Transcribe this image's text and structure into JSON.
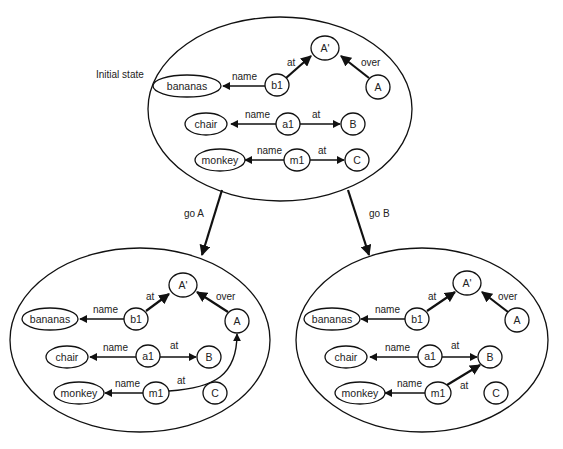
{
  "initial_state": {
    "label": "Initial state",
    "nodes": {
      "bananas": "bananas",
      "b1": "b1",
      "A_prime": "A'",
      "A": "A",
      "chair": "chair",
      "a1": "a1",
      "B": "B",
      "monkey": "monkey",
      "m1": "m1",
      "C": "C"
    },
    "edges": {
      "b1_name": "name",
      "b1_at": "at",
      "A_over": "over",
      "a1_name": "name",
      "a1_at": "at",
      "m1_name": "name",
      "m1_at": "at"
    }
  },
  "transitions": [
    {
      "label": "go A"
    },
    {
      "label": "go B"
    }
  ],
  "state_go_a": {
    "nodes": {
      "bananas": "bananas",
      "b1": "b1",
      "A_prime": "A'",
      "A": "A",
      "chair": "chair",
      "a1": "a1",
      "B": "B",
      "monkey": "monkey",
      "m1": "m1",
      "C": "C"
    },
    "edges": {
      "b1_name": "name",
      "b1_at": "at",
      "A_over": "over",
      "a1_name": "name",
      "a1_at": "at",
      "m1_name": "name",
      "m1_at": "at"
    }
  },
  "state_go_b": {
    "nodes": {
      "bananas": "bananas",
      "b1": "b1",
      "A_prime": "A'",
      "A": "A",
      "chair": "chair",
      "a1": "a1",
      "B": "B",
      "monkey": "monkey",
      "m1": "m1",
      "C": "C"
    },
    "edges": {
      "b1_name": "name",
      "b1_at": "at",
      "A_over": "over",
      "a1_name": "name",
      "a1_at": "at",
      "m1_name": "name",
      "m1_at": "at"
    }
  }
}
